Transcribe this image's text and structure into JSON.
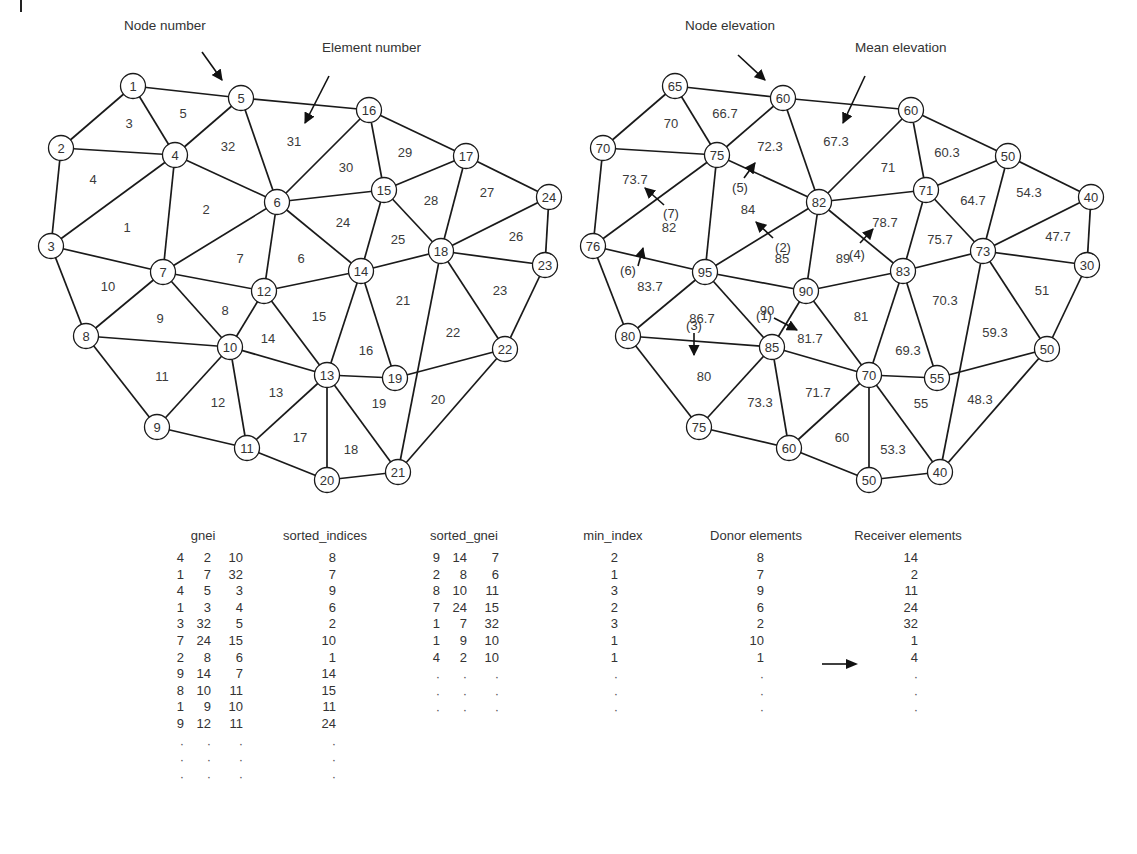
{
  "figure": {
    "left_panel": {
      "callouts": {
        "node": {
          "label": "Node number",
          "x": 124,
          "y": 20,
          "arrow": [
            202,
            52,
            222,
            80
          ]
        },
        "element": {
          "label": "Element number",
          "x": 322,
          "y": 42,
          "arrow": [
            329,
            76,
            305,
            123
          ]
        }
      },
      "nodes": [
        {
          "id": 1,
          "x": 133,
          "y": 86
        },
        {
          "id": 2,
          "x": 61,
          "y": 148
        },
        {
          "id": 3,
          "x": 51,
          "y": 246
        },
        {
          "id": 4,
          "x": 175,
          "y": 155
        },
        {
          "id": 5,
          "x": 241,
          "y": 98
        },
        {
          "id": 6,
          "x": 277,
          "y": 202
        },
        {
          "id": 7,
          "x": 163,
          "y": 272
        },
        {
          "id": 8,
          "x": 86,
          "y": 336
        },
        {
          "id": 9,
          "x": 157,
          "y": 427
        },
        {
          "id": 10,
          "x": 230,
          "y": 347
        },
        {
          "id": 11,
          "x": 247,
          "y": 448
        },
        {
          "id": 12,
          "x": 264,
          "y": 291
        },
        {
          "id": 13,
          "x": 327,
          "y": 375
        },
        {
          "id": 14,
          "x": 361,
          "y": 271
        },
        {
          "id": 15,
          "x": 384,
          "y": 190
        },
        {
          "id": 16,
          "x": 369,
          "y": 110
        },
        {
          "id": 17,
          "x": 466,
          "y": 156
        },
        {
          "id": 18,
          "x": 441,
          "y": 251
        },
        {
          "id": 19,
          "x": 395,
          "y": 378
        },
        {
          "id": 20,
          "x": 327,
          "y": 480
        },
        {
          "id": 21,
          "x": 398,
          "y": 472
        },
        {
          "id": 22,
          "x": 505,
          "y": 349
        },
        {
          "id": 23,
          "x": 545,
          "y": 265
        },
        {
          "id": 24,
          "x": 549,
          "y": 197
        }
      ],
      "elements": [
        {
          "id": 1,
          "x": 127,
          "y": 227
        },
        {
          "id": 2,
          "x": 206,
          "y": 209
        },
        {
          "id": 3,
          "x": 129,
          "y": 123
        },
        {
          "id": 4,
          "x": 93,
          "y": 179
        },
        {
          "id": 5,
          "x": 183,
          "y": 113
        },
        {
          "id": 6,
          "x": 301,
          "y": 258
        },
        {
          "id": 7,
          "x": 240,
          "y": 258
        },
        {
          "id": 8,
          "x": 225,
          "y": 310
        },
        {
          "id": 9,
          "x": 160,
          "y": 318
        },
        {
          "id": 10,
          "x": 108,
          "y": 286
        },
        {
          "id": 11,
          "x": 162,
          "y": 376
        },
        {
          "id": 12,
          "x": 218,
          "y": 402
        },
        {
          "id": 13,
          "x": 276,
          "y": 392
        },
        {
          "id": 14,
          "x": 268,
          "y": 338
        },
        {
          "id": 15,
          "x": 319,
          "y": 316
        },
        {
          "id": 16,
          "x": 366,
          "y": 350
        },
        {
          "id": 17,
          "x": 300,
          "y": 437
        },
        {
          "id": 18,
          "x": 351,
          "y": 449
        },
        {
          "id": 19,
          "x": 379,
          "y": 403
        },
        {
          "id": 20,
          "x": 438,
          "y": 399
        },
        {
          "id": 21,
          "x": 403,
          "y": 300
        },
        {
          "id": 22,
          "x": 453,
          "y": 332
        },
        {
          "id": 23,
          "x": 500,
          "y": 290
        },
        {
          "id": 24,
          "x": 343,
          "y": 222
        },
        {
          "id": 25,
          "x": 398,
          "y": 239
        },
        {
          "id": 26,
          "x": 516,
          "y": 236
        },
        {
          "id": 27,
          "x": 487,
          "y": 192
        },
        {
          "id": 28,
          "x": 431,
          "y": 200
        },
        {
          "id": 29,
          "x": 405,
          "y": 152
        },
        {
          "id": 30,
          "x": 346,
          "y": 167
        },
        {
          "id": 31,
          "x": 294,
          "y": 141
        },
        {
          "id": 32,
          "x": 228,
          "y": 146
        }
      ]
    },
    "right_panel": {
      "offset_x": 542,
      "callouts": {
        "node": {
          "label": "Node elevation",
          "x": 685,
          "y": 20,
          "arrow": [
            738,
            55,
            765,
            80
          ]
        },
        "element": {
          "label": "Mean elevation",
          "x": 855,
          "y": 42,
          "arrow": [
            865,
            76,
            843,
            123
          ]
        }
      },
      "node_elevations": [
        65,
        70,
        76,
        75,
        60,
        82,
        95,
        80,
        75,
        85,
        60,
        90,
        70,
        83,
        71,
        60,
        50,
        73,
        55,
        50,
        40,
        50,
        30,
        40
      ],
      "element_means": [
        "82",
        "84",
        "70",
        "73.7",
        "66.7",
        "89",
        "85",
        "90",
        "86.7",
        "83.7",
        "80",
        "73.3",
        "71.7",
        "81.7",
        "81",
        "69.3",
        "60",
        "53.3",
        "55",
        "48.3",
        "70.3",
        "59.3",
        "51",
        "78.7",
        "75.7",
        "47.7",
        "54.3",
        "64.7",
        "60.3",
        "71",
        "67.3",
        "72.3"
      ],
      "flow_steps": [
        {
          "label": "(1)",
          "x": 764,
          "y": 315,
          "arrow": [
            774,
            318,
            797,
            330
          ]
        },
        {
          "label": "(2)",
          "x": 783,
          "y": 247,
          "arrow": [
            773,
            238,
            756,
            222
          ]
        },
        {
          "label": "(3)",
          "x": 694,
          "y": 325,
          "arrow": [
            694,
            333,
            694,
            355
          ]
        },
        {
          "label": "(4)",
          "x": 857,
          "y": 254,
          "arrow": [
            860,
            243,
            873,
            229
          ]
        },
        {
          "label": "(5)",
          "x": 740,
          "y": 187,
          "arrow": [
            744,
            178,
            755,
            163
          ]
        },
        {
          "label": "(6)",
          "x": 628,
          "y": 270,
          "arrow": [
            638,
            266,
            643,
            248
          ]
        },
        {
          "label": "(7)",
          "x": 671,
          "y": 213,
          "arrow": [
            664,
            205,
            645,
            188
          ]
        }
      ]
    },
    "edges": [
      [
        1,
        5
      ],
      [
        1,
        2
      ],
      [
        1,
        4
      ],
      [
        2,
        4
      ],
      [
        2,
        3
      ],
      [
        3,
        4
      ],
      [
        3,
        7
      ],
      [
        4,
        5
      ],
      [
        4,
        6
      ],
      [
        4,
        7
      ],
      [
        5,
        16
      ],
      [
        5,
        6
      ],
      [
        6,
        16
      ],
      [
        6,
        15
      ],
      [
        6,
        7
      ],
      [
        6,
        12
      ],
      [
        6,
        14
      ],
      [
        7,
        12
      ],
      [
        7,
        10
      ],
      [
        7,
        8
      ],
      [
        3,
        8
      ],
      [
        8,
        10
      ],
      [
        8,
        9
      ],
      [
        9,
        10
      ],
      [
        9,
        11
      ],
      [
        10,
        12
      ],
      [
        10,
        11
      ],
      [
        10,
        13
      ],
      [
        11,
        13
      ],
      [
        11,
        20
      ],
      [
        12,
        13
      ],
      [
        12,
        14
      ],
      [
        13,
        14
      ],
      [
        13,
        19
      ],
      [
        13,
        20
      ],
      [
        13,
        21
      ],
      [
        14,
        15
      ],
      [
        14,
        18
      ],
      [
        14,
        19
      ],
      [
        15,
        16
      ],
      [
        15,
        17
      ],
      [
        15,
        18
      ],
      [
        16,
        17
      ],
      [
        17,
        18
      ],
      [
        17,
        24
      ],
      [
        18,
        24
      ],
      [
        18,
        23
      ],
      [
        18,
        22
      ],
      [
        18,
        21
      ],
      [
        20,
        21
      ],
      [
        21,
        22
      ],
      [
        22,
        23
      ],
      [
        23,
        24
      ],
      [
        19,
        22
      ]
    ],
    "edge_thick": [
      [
        16,
        17
      ]
    ]
  },
  "tables": {
    "transfer_arrow": "→",
    "dot": "·",
    "gnei": {
      "header": "gnei",
      "rows": [
        [
          4,
          2,
          10
        ],
        [
          1,
          7,
          32
        ],
        [
          4,
          5,
          3
        ],
        [
          1,
          3,
          4
        ],
        [
          3,
          32,
          5
        ],
        [
          7,
          24,
          15
        ],
        [
          2,
          8,
          6
        ],
        [
          9,
          14,
          7
        ],
        [
          8,
          10,
          11
        ],
        [
          1,
          9,
          10
        ],
        [
          9,
          12,
          11
        ]
      ]
    },
    "sorted_indices": {
      "header": "sorted_indices",
      "rows": [
        8,
        7,
        9,
        6,
        2,
        10,
        1,
        14,
        15,
        11,
        24
      ]
    },
    "sorted_gnei": {
      "header": "sorted_gnei",
      "rows": [
        [
          9,
          14,
          7
        ],
        [
          2,
          8,
          6
        ],
        [
          8,
          10,
          11
        ],
        [
          7,
          24,
          15
        ],
        [
          1,
          7,
          32
        ],
        [
          1,
          9,
          10
        ],
        [
          4,
          2,
          10
        ]
      ]
    },
    "min_index": {
      "header": "min_index",
      "rows": [
        2,
        1,
        3,
        2,
        3,
        1,
        1
      ]
    },
    "donor": {
      "header": "Donor elements",
      "rows": [
        8,
        7,
        9,
        6,
        2,
        10,
        1
      ]
    },
    "receiver": {
      "header": "Receiver elements",
      "rows": [
        14,
        2,
        11,
        24,
        32,
        1,
        4
      ]
    }
  }
}
